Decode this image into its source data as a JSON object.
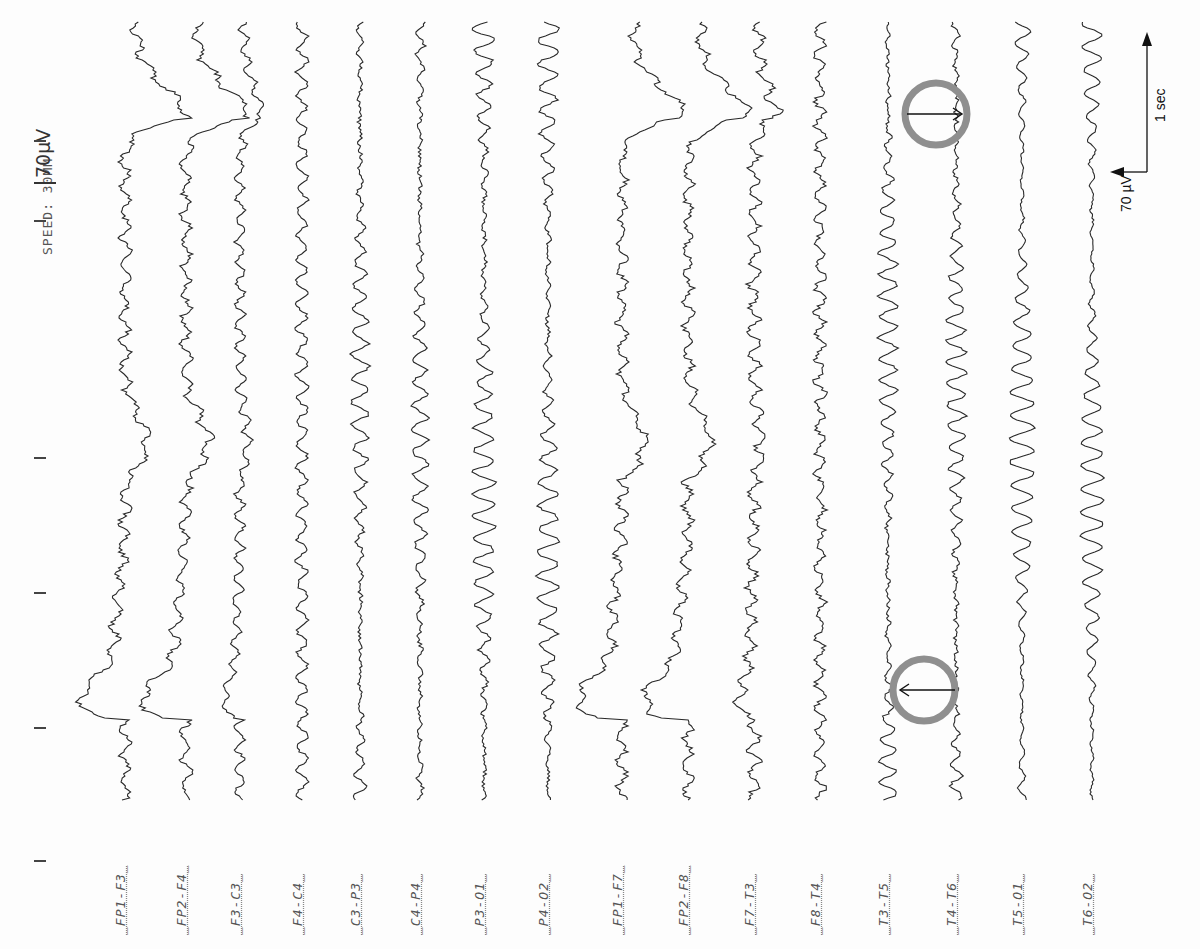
{
  "figure": {
    "speed_label": "SPEED: 30MM",
    "gain_label": "70µV",
    "scale_bar": {
      "time_label": "1 sec",
      "amplitude_label": "70 µV"
    },
    "ink_color": "#2a2a2a",
    "marker_color": "#8f8f8f"
  },
  "ticks_y": [
    140,
    220,
    457,
    592,
    727,
    860
  ],
  "channels": [
    {
      "name": "FP1-F3",
      "x": 125,
      "amp": 5,
      "freq": 0.9,
      "noise": 3,
      "kind": "eye",
      "side": "L"
    },
    {
      "name": "FP2-F4",
      "x": 186,
      "amp": 5,
      "freq": 0.9,
      "noise": 3,
      "kind": "eye",
      "side": "R"
    },
    {
      "name": "F3-C3",
      "x": 240,
      "amp": 5,
      "freq": 1.1,
      "noise": 2,
      "kind": "eye-small"
    },
    {
      "name": "F4-C4",
      "x": 302,
      "amp": 6,
      "freq": 1.0,
      "noise": 2,
      "kind": "normal"
    },
    {
      "name": "C3-P3",
      "x": 360,
      "amp": 10,
      "freq": 1.0,
      "noise": 2,
      "kind": "alpha"
    },
    {
      "name": "C4-P4",
      "x": 420,
      "amp": 9,
      "freq": 1.0,
      "noise": 2,
      "kind": "alpha"
    },
    {
      "name": "P3-O1",
      "x": 484,
      "amp": 13,
      "freq": 1.05,
      "noise": 2,
      "kind": "alpha"
    },
    {
      "name": "P4-O2",
      "x": 548,
      "amp": 12,
      "freq": 1.0,
      "noise": 2,
      "kind": "alpha"
    },
    {
      "name": "FP1-F7",
      "x": 622,
      "amp": 5,
      "freq": 0.9,
      "noise": 3,
      "kind": "eye",
      "side": "L"
    },
    {
      "name": "FP2-F8",
      "x": 688,
      "amp": 5,
      "freq": 0.9,
      "noise": 3,
      "kind": "eye",
      "side": "R"
    },
    {
      "name": "F7-T3",
      "x": 754,
      "amp": 6,
      "freq": 1.0,
      "noise": 3,
      "kind": "eye-small"
    },
    {
      "name": "F8-T4",
      "x": 820,
      "amp": 5,
      "freq": 1.0,
      "noise": 3,
      "kind": "normal"
    },
    {
      "name": "T3-T5",
      "x": 888,
      "amp": 11,
      "freq": 1.1,
      "noise": 2,
      "kind": "alpha"
    },
    {
      "name": "T4-T6",
      "x": 956,
      "amp": 11,
      "freq": 1.1,
      "noise": 2,
      "kind": "alpha"
    },
    {
      "name": "T5-O1",
      "x": 1022,
      "amp": 14,
      "freq": 1.0,
      "noise": 1,
      "kind": "alpha"
    },
    {
      "name": "T6-O2",
      "x": 1092,
      "amp": 13,
      "freq": 1.0,
      "noise": 1,
      "kind": "alpha"
    }
  ],
  "markers": [
    {
      "cx": 936,
      "cy": 114,
      "r": 31,
      "arrow_from_x": 907,
      "arrow_to_x": 962
    },
    {
      "cx": 924,
      "cy": 690,
      "r": 31,
      "arrow_from_x": 955,
      "arrow_to_x": 900
    }
  ]
}
